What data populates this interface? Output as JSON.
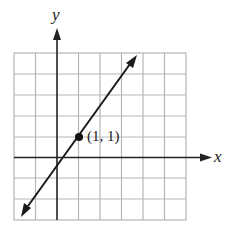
{
  "figure": {
    "type": "coordinate-graph",
    "axes": {
      "x_label": "x",
      "y_label": "y"
    },
    "grid": {
      "columns": 8,
      "rows": 8,
      "x_range": [
        -2,
        6
      ],
      "y_range": [
        -3,
        5
      ]
    },
    "line": {
      "equation": "y = 2x - 1",
      "slope": 2,
      "intercept": -1,
      "arrows": "both"
    },
    "point": {
      "x": 1,
      "y": 1,
      "label": "(1, 1)"
    },
    "colors": {
      "grid": "#b5b5b5",
      "axes": "#222222",
      "line": "#1a1a1a"
    }
  }
}
